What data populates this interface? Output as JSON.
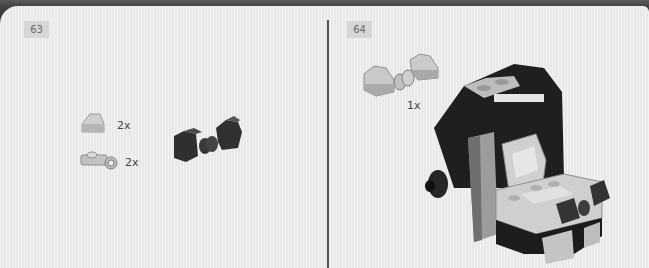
{
  "page": {
    "type": "LEGO building instructions",
    "colors": {
      "background": "#ececec",
      "header_bar": "#3e3e3e",
      "badge": "#d6d6d6",
      "divider": "#555555"
    }
  },
  "steps": [
    {
      "number": "63",
      "parts_callout": [
        {
          "part": "light-gray-slope-1x1",
          "quantity": "2x"
        },
        {
          "part": "light-gray-plate-with-clip",
          "quantity": "2x"
        }
      ],
      "assembly": "dark-gray-slopes-joined-by-clip-and-bar"
    },
    {
      "number": "64",
      "parts_callout": [
        {
          "part": "light-gray-submodel-slopes-with-clip",
          "quantity": "1x"
        }
      ],
      "assembly": "black-and-gray-vehicle-cab-model"
    }
  ]
}
